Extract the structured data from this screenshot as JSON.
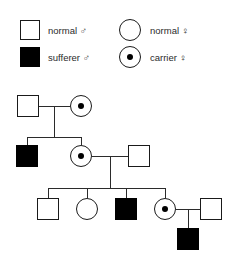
{
  "legend": {
    "entries": [
      {
        "id": "normal-male",
        "symbol": "open-square",
        "label": "normal ♂"
      },
      {
        "id": "sufferer-male",
        "symbol": "filled-square",
        "label": "sufferer ♂"
      },
      {
        "id": "normal-female",
        "symbol": "open-circle",
        "label": "normal ♀"
      },
      {
        "id": "carrier-female",
        "symbol": "dotted-circle",
        "label": "carrier ♀"
      }
    ]
  },
  "colors": {
    "affected": "#000000",
    "unaffected": "#ffffff",
    "outline": "#1a1a1a",
    "line": "#2b2b2b",
    "background": "#ffffff"
  },
  "pedigree": {
    "generations": [
      {
        "generation": 1,
        "individuals": [
          {
            "id": "I-1",
            "sex": "male",
            "status": "normal"
          },
          {
            "id": "I-2",
            "sex": "female",
            "status": "carrier"
          }
        ]
      },
      {
        "generation": 2,
        "individuals": [
          {
            "id": "II-1",
            "sex": "male",
            "status": "sufferer"
          },
          {
            "id": "II-2",
            "sex": "female",
            "status": "carrier"
          },
          {
            "id": "II-3",
            "sex": "male",
            "status": "normal"
          }
        ]
      },
      {
        "generation": 3,
        "individuals": [
          {
            "id": "III-1",
            "sex": "male",
            "status": "normal"
          },
          {
            "id": "III-2",
            "sex": "female",
            "status": "normal"
          },
          {
            "id": "III-3",
            "sex": "male",
            "status": "sufferer"
          },
          {
            "id": "III-4",
            "sex": "female",
            "status": "carrier"
          },
          {
            "id": "III-5",
            "sex": "male",
            "status": "normal"
          }
        ]
      },
      {
        "generation": 4,
        "individuals": [
          {
            "id": "IV-1",
            "sex": "male",
            "status": "sufferer"
          }
        ]
      }
    ]
  }
}
